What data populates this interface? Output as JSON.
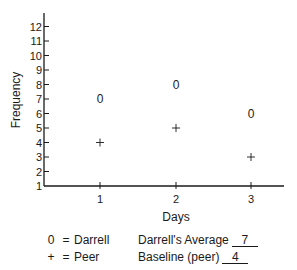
{
  "chart_data": {
    "type": "scatter",
    "title": "",
    "xlabel": "Days",
    "ylabel": "Frequency",
    "x": [
      1,
      2,
      3
    ],
    "xticks": [
      "1",
      "2",
      "3"
    ],
    "yticks": [
      "1",
      "2",
      "3",
      "4",
      "5",
      "6",
      "7",
      "8",
      "9",
      "10",
      "11",
      "12"
    ],
    "ylim": [
      1,
      12
    ],
    "grid": false,
    "series": [
      {
        "name": "Darrell",
        "marker": "0",
        "values": [
          7,
          8,
          6
        ]
      },
      {
        "name": "Peer",
        "marker": "+",
        "values": [
          4,
          5,
          3
        ]
      }
    ],
    "legend_position": "bottom"
  },
  "legend": {
    "darrell": {
      "symbol": "0",
      "equals": "=",
      "label": "Darrell"
    },
    "peer": {
      "symbol": "+",
      "equals": "=",
      "label": "Peer"
    }
  },
  "summary": {
    "darrell_average": {
      "label": "Darrell's Average",
      "value": "7"
    },
    "baseline_peer": {
      "label": "Baseline (peer)",
      "value": "4"
    }
  }
}
